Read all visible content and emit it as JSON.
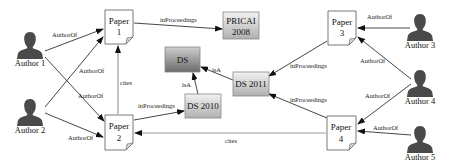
{
  "diagram": {
    "authors": [
      {
        "id": "author1",
        "label": "Author 1"
      },
      {
        "id": "author2",
        "label": "Author 2"
      },
      {
        "id": "author3",
        "label": "Author 3"
      },
      {
        "id": "author4",
        "label": "Author 4"
      },
      {
        "id": "author5",
        "label": "Author 5"
      }
    ],
    "papers": [
      {
        "id": "paper1",
        "line1": "Paper",
        "line2": "1"
      },
      {
        "id": "paper2",
        "line1": "Paper",
        "line2": "2"
      },
      {
        "id": "paper3",
        "line1": "Paper",
        "line2": "3"
      },
      {
        "id": "paper4",
        "line1": "Paper",
        "line2": "4"
      }
    ],
    "venues": [
      {
        "id": "pricai2008",
        "line1": "PRICAI",
        "line2": "2008"
      },
      {
        "id": "ds",
        "label": "DS"
      },
      {
        "id": "ds2010",
        "label": "DS 2010"
      },
      {
        "id": "ds2011",
        "label": "DS 2011"
      }
    ],
    "edges": [
      {
        "from": "author1",
        "to": "paper1",
        "label": "AuthorOf"
      },
      {
        "from": "author1",
        "to": "paper2",
        "label": "AuthorOf"
      },
      {
        "from": "author2",
        "to": "paper1",
        "label": "AuthorOf"
      },
      {
        "from": "author2",
        "to": "paper2",
        "label": "AuthorOf"
      },
      {
        "from": "author3",
        "to": "paper3",
        "label": "AuthorOf"
      },
      {
        "from": "author4",
        "to": "paper3",
        "label": "AuthorOf"
      },
      {
        "from": "author4",
        "to": "paper4",
        "label": "AuthorOf"
      },
      {
        "from": "author5",
        "to": "paper4",
        "label": "AuthorOf"
      },
      {
        "from": "paper1",
        "to": "pricai2008",
        "label": "inProceedings"
      },
      {
        "from": "paper2",
        "to": "ds2010",
        "label": "inProceedings"
      },
      {
        "from": "paper3",
        "to": "ds2011",
        "label": "inProceedings"
      },
      {
        "from": "paper4",
        "to": "ds2011",
        "label": "inProceedings"
      },
      {
        "from": "ds2010",
        "to": "ds",
        "label": "isA"
      },
      {
        "from": "ds2011",
        "to": "ds",
        "label": "isA"
      },
      {
        "from": "paper2",
        "to": "paper1",
        "label": "cites"
      },
      {
        "from": "paper4",
        "to": "paper2",
        "label": "cites"
      }
    ],
    "colors": {
      "person": "#4a4a4a",
      "edge": "#333333",
      "cites_edge": "#999999"
    }
  }
}
